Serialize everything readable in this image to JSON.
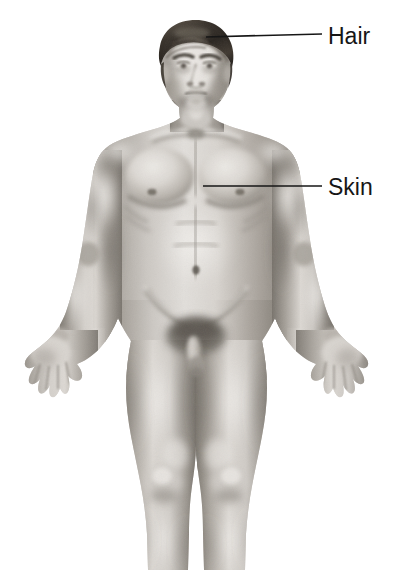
{
  "figure": {
    "view": "anterior",
    "style": "grayscale-airbrush-medical-illustration",
    "background_color": "#ffffff",
    "ink_color": "#161616"
  },
  "labels": [
    {
      "id": "hair",
      "text": "Hair",
      "text_x": 328,
      "text_y": 44,
      "leader": {
        "start_x": 206,
        "start_y": 37,
        "end_x": 322,
        "end_y": 34
      }
    },
    {
      "id": "skin",
      "text": "Skin",
      "text_x": 328,
      "text_y": 195,
      "leader": {
        "start_x": 203,
        "start_y": 186,
        "end_x": 322,
        "end_y": 186
      }
    }
  ],
  "palette": {
    "paper": "#ffffff",
    "skin_light": "#e4e1dd",
    "skin_mid": "#c3bfba",
    "skin_shadow": "#9a958f",
    "skin_deep": "#7b766f",
    "skin_darkest": "#5e5952",
    "hair_dark": "#2e2a26",
    "hair_mid": "#4a443d",
    "hair_light": "#6f675e",
    "line": "#161616"
  }
}
